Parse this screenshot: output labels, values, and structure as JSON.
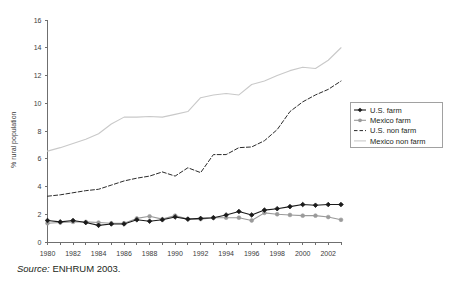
{
  "figure": {
    "source_prefix": "Source:",
    "source_text": "ENHRUM 2003."
  },
  "chart_data": {
    "type": "line",
    "title": "",
    "xlabel": "",
    "ylabel": "% rural population",
    "xlim": [
      1980,
      2003
    ],
    "ylim": [
      0,
      16
    ],
    "yticks": [
      0,
      2,
      4,
      6,
      8,
      10,
      12,
      14,
      16
    ],
    "ytick_labels": [
      "0",
      "2",
      "4",
      "6",
      "8",
      "10",
      "12",
      "14",
      "16"
    ],
    "xticks": [
      1980,
      1981,
      1982,
      1983,
      1984,
      1985,
      1986,
      1987,
      1988,
      1989,
      1990,
      1991,
      1992,
      1993,
      1994,
      1995,
      1996,
      1997,
      1998,
      1999,
      2000,
      2001,
      2002,
      2003
    ],
    "xtick_labels_shown": [
      "1980",
      "1982",
      "1984",
      "1986",
      "1988",
      "1990",
      "1992",
      "1994",
      "1996",
      "1998",
      "2000",
      "2002"
    ],
    "grid": false,
    "legend_position": "right",
    "x": [
      1980,
      1981,
      1982,
      1983,
      1984,
      1985,
      1986,
      1987,
      1988,
      1989,
      1990,
      1991,
      1992,
      1993,
      1994,
      1995,
      1996,
      1997,
      1998,
      1999,
      2000,
      2001,
      2002,
      2003
    ],
    "series": [
      {
        "name": "U.S. farm",
        "color": "#1a1a1a",
        "style": "solid",
        "marker": "diamond",
        "values": [
          1.55,
          1.45,
          1.55,
          1.4,
          1.2,
          1.3,
          1.3,
          1.6,
          1.5,
          1.6,
          1.8,
          1.65,
          1.7,
          1.75,
          1.95,
          2.2,
          1.95,
          2.3,
          2.4,
          2.55,
          2.7,
          2.65,
          2.7,
          2.7
        ]
      },
      {
        "name": "Mexico farm",
        "color": "#9a9a9a",
        "style": "solid",
        "marker": "circle",
        "values": [
          1.35,
          1.4,
          1.45,
          1.45,
          1.4,
          1.35,
          1.35,
          1.7,
          1.85,
          1.65,
          1.9,
          1.65,
          1.65,
          1.75,
          1.75,
          1.75,
          1.55,
          2.1,
          2.0,
          1.95,
          1.9,
          1.9,
          1.8,
          1.6
        ]
      },
      {
        "name": "U.S. non farm",
        "color": "#2b2b2b",
        "style": "dashed",
        "marker": "none",
        "values": [
          3.3,
          3.4,
          3.55,
          3.7,
          3.8,
          4.1,
          4.4,
          4.6,
          4.75,
          5.05,
          4.75,
          5.35,
          5.0,
          6.3,
          6.3,
          6.8,
          6.85,
          7.3,
          8.1,
          9.4,
          10.1,
          10.6,
          11.0,
          11.6
        ]
      },
      {
        "name": "Mexico non farm",
        "color": "#c9c9c9",
        "style": "solid",
        "marker": "none",
        "values": [
          6.55,
          6.8,
          7.1,
          7.4,
          7.8,
          8.5,
          9.0,
          9.0,
          9.05,
          9.0,
          9.2,
          9.4,
          10.4,
          10.6,
          10.7,
          10.6,
          11.35,
          11.6,
          12.0,
          12.35,
          12.6,
          12.5,
          13.1,
          14.0
        ]
      }
    ],
    "legend": [
      "U.S. farm",
      "Mexico farm",
      "U.S. non farm",
      "Mexico non farm"
    ]
  }
}
